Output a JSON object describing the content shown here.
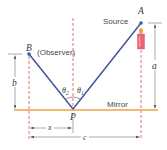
{
  "diagram": {
    "labels": {
      "source": "Source",
      "point_a": "A",
      "point_b": "B",
      "observer": "(Observer)",
      "point_p": "P",
      "mirror": "Mirror",
      "theta1": "θ",
      "theta1_sub": "1",
      "theta2": "θ",
      "theta2_sub": "2",
      "dim_a": "a",
      "dim_b": "b",
      "dim_x": "x",
      "dim_c": "c"
    },
    "colors": {
      "ray": "#3d4f9c",
      "point": "#2f5fb5",
      "mirror": "#f0a040",
      "dashed": "#e0505a",
      "dimension": "#555555",
      "candle_body": "#e8667a",
      "flame": "#f0a030"
    }
  }
}
